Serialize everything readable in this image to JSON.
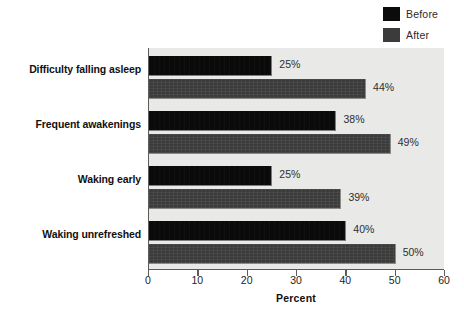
{
  "chart_data": {
    "type": "bar",
    "orientation": "horizontal",
    "title": "",
    "xlabel": "Percent",
    "ylabel": "",
    "xlim": [
      0,
      60
    ],
    "xticks": [
      0,
      10,
      20,
      30,
      40,
      50,
      60
    ],
    "grid": false,
    "legend_position": "top-right",
    "categories": [
      "Difficulty falling asleep",
      "Frequent awakenings",
      "Waking early",
      "Waking unrefreshed"
    ],
    "series": [
      {
        "name": "Before",
        "color": "#0a0a0a",
        "values": [
          25,
          38,
          25,
          40
        ],
        "labels": [
          "25%",
          "38%",
          "25%",
          "40%"
        ]
      },
      {
        "name": "After",
        "color": "#3b3b3b",
        "values": [
          44,
          49,
          39,
          50
        ],
        "labels": [
          "44%",
          "49%",
          "39%",
          "50%"
        ]
      }
    ]
  },
  "legend": {
    "items": [
      {
        "label": "Before",
        "swatch": "before-swatch-icon",
        "color": "#0a0a0a"
      },
      {
        "label": "After",
        "swatch": "after-swatch-icon",
        "color": "#3b3b3b"
      }
    ]
  },
  "axis": {
    "x_title": "Percent",
    "tick_labels": [
      "0",
      "10",
      "20",
      "30",
      "40",
      "50",
      "60"
    ]
  },
  "colors": {
    "plot_background": "#e9e9e7",
    "page_background": "#ffffff",
    "axis_line": "#5c5c5c",
    "text": "#111111",
    "value_text": "#2e2e2e"
  }
}
